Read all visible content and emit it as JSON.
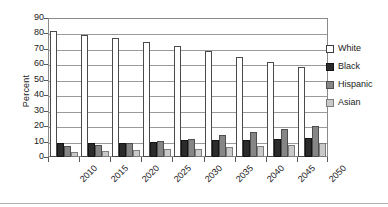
{
  "chart_data": {
    "type": "bar",
    "title": "",
    "xlabel": "",
    "ylabel": "Percent",
    "ylim": [
      0,
      90
    ],
    "ytick_step": 10,
    "yticks": [
      90,
      80,
      70,
      60,
      50,
      40,
      30,
      20,
      10,
      0
    ],
    "grid": true,
    "legend_position": "right",
    "categories": [
      "2010",
      "2015",
      "2020",
      "2025",
      "2030",
      "2035",
      "2040",
      "2045",
      "2050"
    ],
    "series": [
      {
        "name": "White",
        "color": "#ffffff",
        "values": [
          81.5,
          79.0,
          77.0,
          74.5,
          72.0,
          68.5,
          65.0,
          61.5,
          58.5
        ]
      },
      {
        "name": "Black",
        "color": "#2b2b2b",
        "values": [
          9.0,
          9.0,
          9.3,
          10.0,
          10.8,
          11.0,
          11.2,
          11.8,
          12.0
        ]
      },
      {
        "name": "Hispanic",
        "color": "#868686",
        "values": [
          7.2,
          8.0,
          9.2,
          10.5,
          11.7,
          14.0,
          16.3,
          18.2,
          19.8
        ]
      },
      {
        "name": "Asian",
        "color": "#c9c9c9",
        "values": [
          3.5,
          4.2,
          4.7,
          5.0,
          5.4,
          6.3,
          7.1,
          8.0,
          9.3
        ]
      }
    ]
  },
  "legend": {
    "items": [
      {
        "label": "White",
        "swatch": "white"
      },
      {
        "label": "Black",
        "swatch": "black"
      },
      {
        "label": "Hispanic",
        "swatch": "hispanic"
      },
      {
        "label": "Asian",
        "swatch": "asian"
      }
    ]
  }
}
